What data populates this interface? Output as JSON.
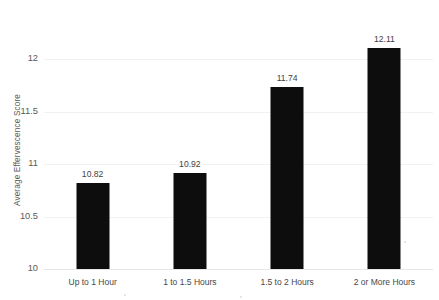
{
  "chart_data": {
    "type": "bar",
    "title": "",
    "xlabel": "",
    "ylabel": "Average Effervescence Score",
    "categories": [
      "Up to 1 Hour",
      "1 to 1.5 Hours",
      "1.5 to 2 Hours",
      "2 or More Hours"
    ],
    "values": [
      10.82,
      10.92,
      11.74,
      12.11
    ],
    "value_labels": [
      "10.82",
      "10.92",
      "11.74",
      "12.11"
    ],
    "ylim": [
      10,
      12.25
    ],
    "y_ticks": [
      10,
      10.5,
      11,
      11.5,
      12
    ],
    "y_tick_labels": [
      "10",
      "10.5",
      "11",
      "11.5",
      "12"
    ],
    "grid": "horizontal",
    "legend": "none",
    "bar_color": "#0d0d0d",
    "gridline_color": "#f2f2f2",
    "background_color": "#ffffff",
    "text_color": "#4d4d4d"
  }
}
